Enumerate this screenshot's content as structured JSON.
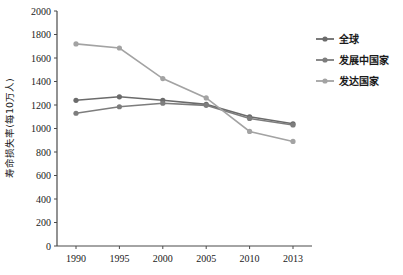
{
  "chart_data": {
    "type": "line",
    "title": "",
    "xlabel": "",
    "ylabel": "寿命损失率(每10万人)",
    "categories": [
      "1990",
      "1995",
      "2000",
      "2005",
      "2010",
      "2013"
    ],
    "x": [
      1990,
      1995,
      2000,
      2005,
      2010,
      2013
    ],
    "ylim": [
      0,
      2000
    ],
    "yticks": [
      "0",
      "200",
      "400",
      "600",
      "800",
      "1000",
      "1200",
      "1400",
      "1600",
      "1800",
      "2000"
    ],
    "ytick_values": [
      0,
      200,
      400,
      600,
      800,
      1000,
      1200,
      1400,
      1600,
      1800,
      2000
    ],
    "grid": false,
    "legend_position": "right",
    "series": [
      {
        "name": "全球",
        "color": "#6b6b6b",
        "marker": "circle",
        "values": [
          1240,
          1270,
          1240,
          1205,
          1100,
          1040
        ]
      },
      {
        "name": "发展中国家",
        "color": "#7d7d7d",
        "marker": "circle",
        "values": [
          1130,
          1185,
          1215,
          1197,
          1085,
          1030
        ]
      },
      {
        "name": "发达国家",
        "color": "#a3a3a3",
        "marker": "circle",
        "values": [
          1720,
          1685,
          1425,
          1260,
          975,
          890
        ]
      }
    ]
  },
  "axis": {
    "axis_color": "#4a4a4a",
    "text_color": "#1a1a1a"
  },
  "legend": {
    "items": [
      {
        "label": "全球",
        "color": "#6b6b6b"
      },
      {
        "label": "发展中国家",
        "color": "#7d7d7d"
      },
      {
        "label": "发达国家",
        "color": "#a3a3a3"
      }
    ]
  }
}
